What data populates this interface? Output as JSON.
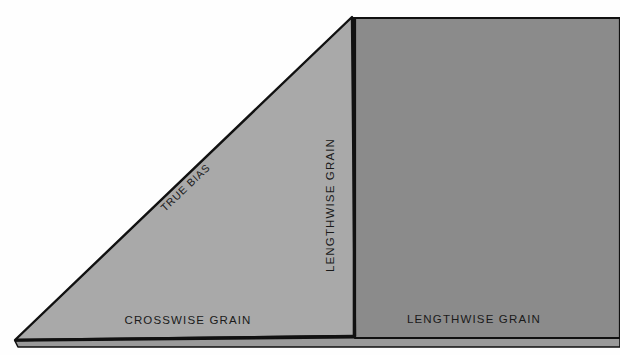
{
  "diagram": {
    "background_color": "#fefefe",
    "outline_color": "#111111",
    "regions": [
      {
        "name": "bias-triangle",
        "label": "TRUE BIAS",
        "fill_color": "#a9a9a9"
      },
      {
        "name": "lengthwise-panel",
        "label": "LENGTHWISE GRAIN",
        "fill_color": "#8b8b8b"
      },
      {
        "name": "fold-underlayer",
        "label": "",
        "fill_color": "#9a9a9a"
      }
    ],
    "labels": {
      "true_bias": "TRUE BIAS",
      "lengthwise_grain_vertical": "LENGTHWISE GRAIN",
      "crosswise_grain": "CROSSWISE GRAIN",
      "lengthwise_grain_bottom": "LENGTHWISE GRAIN"
    }
  }
}
